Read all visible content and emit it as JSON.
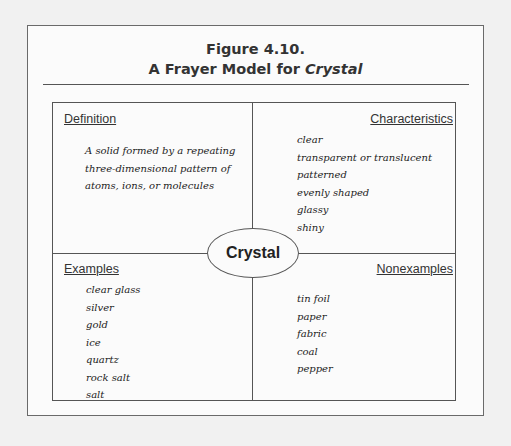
{
  "figure": {
    "number": "Figure 4.10.",
    "title_prefix": "A Frayer Model for ",
    "title_term": "Crystal"
  },
  "center_term": "Crystal",
  "quadrants": {
    "definition": {
      "heading": "Definition",
      "lines": [
        "A solid formed by a repeating",
        "three-dimensional pattern of",
        "atoms, ions, or molecules"
      ]
    },
    "characteristics": {
      "heading": "Characteristics",
      "items": [
        "clear",
        "transparent or translucent",
        "patterned",
        "evenly shaped",
        "glassy",
        "shiny"
      ]
    },
    "examples": {
      "heading": "Examples",
      "items": [
        "clear glass",
        "silver",
        "gold",
        "ice",
        "quartz",
        "rock salt",
        "salt"
      ]
    },
    "nonexamples": {
      "heading": "Nonexamples",
      "items": [
        "tin foil",
        "paper",
        "fabric",
        "coal",
        "pepper"
      ]
    }
  }
}
